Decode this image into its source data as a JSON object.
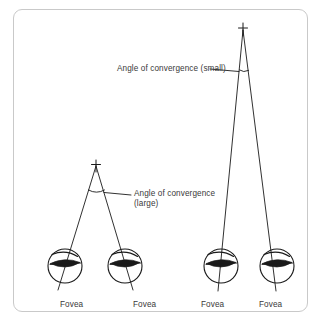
{
  "figure": {
    "title_visible": false,
    "background_color": "#ffffff",
    "frame_border_color": "#c9c9c9",
    "ink_color": "#1a1a1a",
    "text_color": "#3a3a3a"
  },
  "labels": {
    "angle_small": "Angle of convergence (small)",
    "angle_large_line1": "Angle of convergence",
    "angle_large_line2": "(large)",
    "fovea": "Fovea"
  },
  "fovea_labels": [
    {
      "text": "Fovea"
    },
    {
      "text": "Fovea"
    },
    {
      "text": "Fovea"
    },
    {
      "text": "Fovea"
    }
  ],
  "diagram": {
    "near_pair": {
      "target_marker": "plus-cross",
      "target_point": {
        "x": 96,
        "y": 163
      },
      "left_eye_center": {
        "x": 65,
        "y": 266
      },
      "right_eye_center": {
        "x": 125,
        "y": 266
      },
      "eye_radius": 17,
      "angle_label": "Angle of convergence (large)",
      "angle_size": "large"
    },
    "far_pair": {
      "target_marker": "plus-cross",
      "target_point": {
        "x": 243,
        "y": 27
      },
      "left_eye_center": {
        "x": 221,
        "y": 266
      },
      "right_eye_center": {
        "x": 277,
        "y": 266
      },
      "eye_radius": 17,
      "angle_label": "Angle of convergence (small)",
      "angle_size": "small"
    }
  }
}
